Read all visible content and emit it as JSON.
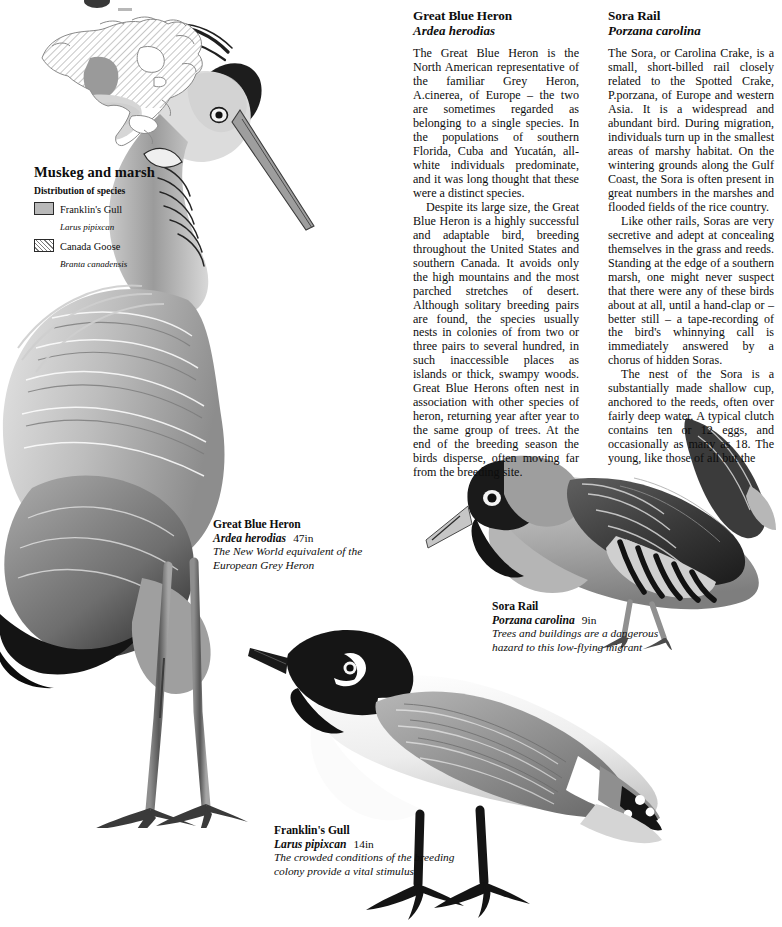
{
  "page": {
    "background": "#ffffff",
    "ink": "#0d0d0d"
  },
  "map_panel": {
    "title": "Muskeg and marsh",
    "subtitle": "Distribution of species",
    "map_name": "north-america-distribution-map",
    "legend": [
      {
        "swatch": "solid-grey",
        "color": "#b9b9b9",
        "common": "Franklin's Gull",
        "latin": "Larus pipixcan"
      },
      {
        "swatch": "diagonal-hatch",
        "color": "#7d7d7d",
        "common": "Canada Goose",
        "latin": "Branta canadensis"
      }
    ]
  },
  "articles": [
    {
      "id": "great-blue-heron",
      "title": "Great Blue Heron",
      "scientific": "Ardea herodias",
      "paragraphs": [
        "The Great Blue Heron is the North American representative of the familiar Grey Heron, A.cinerea, of Europe – the two are sometimes regarded as belonging to a single species. In the populations of southern Florida, Cuba and Yucatán, all-white individuals predominate, and it was long thought that these were a distinct species.",
        "Despite its large size, the Great Blue Heron is a highly successful and adaptable bird, breeding throughout the United States and southern Canada. It avoids only the high mountains and the most parched stretches of desert. Although solitary breeding pairs are found, the species usually nests in colonies of from two or three pairs to several hundred, in such inaccessible places as islands or thick, swampy woods. Great Blue Herons often nest in association with other species of heron, returning year after year to the same group of trees. At the end of the breeding season the birds disperse, often moving far from the breeding site."
      ]
    },
    {
      "id": "sora-rail",
      "title": "Sora Rail",
      "scientific": "Porzana carolina",
      "paragraphs": [
        "The Sora, or Carolina Crake, is a small, short-billed rail closely related to the Spotted Crake, P.porzana, of Europe and western Asia. It is a widespread and abundant bird. During migration, individuals turn up in the smallest areas of marshy habitat. On the wintering grounds along the Gulf Coast, the Sora is often present in great numbers in the marshes and flooded fields of the rice country.",
        "Like other rails, Soras are very secretive and adept at concealing themselves in the grass and reeds. Standing at the edge of a southern marsh, one might never suspect that there were any of these birds about at all, until a hand-clap or – better still – a tape-recording of the bird's whinnying call is immediately answered by a chorus of hidden Soras.",
        "The nest of the Sora is a substantially made shallow cup, anchored to the reeds, often over fairly deep water. A typical clutch contains ten or 12 eggs, and occasionally as many as 18. The young, like those of all but the"
      ]
    }
  ],
  "figures": [
    {
      "id": "great-blue-heron-figure",
      "common": "Great Blue Heron",
      "scientific": "Ardea herodias",
      "size": "47in",
      "note": "The New World equivalent of the European Grey Heron"
    },
    {
      "id": "sora-rail-figure",
      "common": "Sora Rail",
      "scientific": "Porzana carolina",
      "size": "9in",
      "note": "Trees and buildings are a dangerous hazard to this low-flying migrant"
    },
    {
      "id": "franklins-gull-figure",
      "common": "Franklin's Gull",
      "scientific": "Larus pipixcan",
      "size": "14in",
      "note": "The crowded conditions of the breeding colony provide a vital stimulus"
    }
  ]
}
